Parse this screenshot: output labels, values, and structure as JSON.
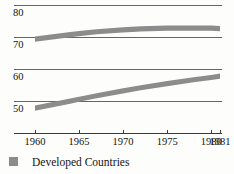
{
  "chart_data": {
    "type": "area",
    "title": "",
    "subtitle": "",
    "xlabel": "",
    "ylabel": "",
    "grid": true,
    "legend_position": "bottom-left",
    "x": [
      1960,
      1965,
      1970,
      1975,
      1980,
      1981
    ],
    "xtick_labels": [
      "1960",
      "1965",
      "1970",
      "1975",
      "1980",
      "1981"
    ],
    "xlim": [
      1959,
      1981
    ],
    "panels": [
      {
        "name": "upper-panel",
        "ylim": [
          65,
          82
        ],
        "ytick_labels": [
          "80",
          "70"
        ],
        "ytick_values": [
          80,
          70
        ],
        "series": [
          {
            "name": "Developed Countries",
            "color": "#8c8c8c",
            "band_width": 1.0,
            "x": [
              1960,
              1962,
              1964,
              1965,
              1967,
              1970,
              1972,
              1975,
              1978,
              1980,
              1981
            ],
            "values": [
              69.5,
              70.2,
              70.9,
              71.2,
              71.8,
              72.4,
              72.7,
              72.9,
              72.9,
              72.9,
              72.8
            ]
          }
        ]
      },
      {
        "name": "lower-panel",
        "ylim": [
          45,
          62
        ],
        "ytick_labels": [
          "60",
          "50"
        ],
        "ytick_values": [
          60,
          50
        ],
        "series": [
          {
            "name": "Developed Countries",
            "color": "#8c8c8c",
            "band_width": 1.0,
            "x": [
              1960,
              1962,
              1964,
              1965,
              1967,
              1970,
              1972,
              1975,
              1978,
              1980,
              1981
            ],
            "values": [
              47.9,
              49.0,
              50.1,
              50.7,
              51.8,
              53.3,
              54.3,
              55.6,
              56.8,
              57.5,
              57.9
            ]
          }
        ]
      }
    ]
  },
  "legend": {
    "items": [
      {
        "label": "Developed Countries",
        "color": "#8c8c8c"
      }
    ]
  },
  "colors": {
    "band": "#8c8c8c",
    "grid": "#545454",
    "axis": "#3a3a3a",
    "text": "#141414",
    "background": "#fdfdfb"
  }
}
